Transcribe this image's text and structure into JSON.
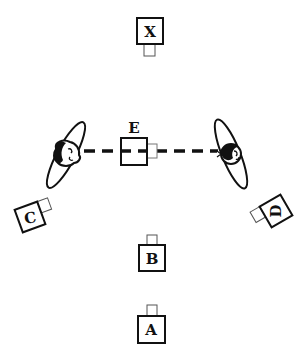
{
  "diagram": {
    "title": "",
    "colors": {
      "stroke": "#111111",
      "tab_stroke": "#555555",
      "background": "#ffffff"
    },
    "cameras": [
      {
        "id": "X",
        "label": "X",
        "note": "box with tab below"
      },
      {
        "id": "E",
        "label": "E",
        "note": "box with tab right, on dashed line"
      },
      {
        "id": "C",
        "label": "C",
        "note": "tilted box with tab upper-right"
      },
      {
        "id": "D",
        "label": "D",
        "note": "tilted box with tab upper-left"
      },
      {
        "id": "B",
        "label": "B",
        "note": "box with tab above"
      },
      {
        "id": "A",
        "label": "A",
        "note": "box with tab above"
      }
    ],
    "figures": [
      {
        "id": "left-person",
        "icon": "person-top-view-icon"
      },
      {
        "id": "right-person",
        "icon": "person-top-view-icon"
      }
    ],
    "connector": {
      "style": "dashed",
      "between": [
        "left-person",
        "right-person"
      ]
    }
  }
}
